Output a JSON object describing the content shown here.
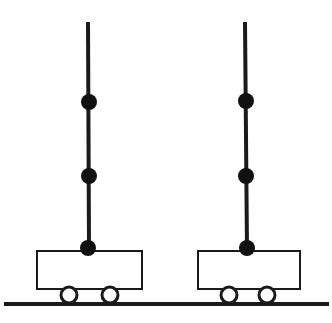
{
  "figure": {
    "canvas": {
      "width": 332,
      "height": 323,
      "background": "#ffffff"
    },
    "colors": {
      "stroke": "#1a1a1a",
      "bead_fill": "#111111",
      "wheel_fill": "#ffffff",
      "cart_fill": "#ffffff",
      "ground": "#1a1a1a"
    },
    "ground": {
      "label": "ground-line",
      "x1": 4,
      "y1": 304,
      "x2": 329,
      "y2": 304,
      "thickness": 4
    },
    "systems": [
      {
        "name": "left-cart-pendulum",
        "rod": {
          "x_top": 88,
          "y_top": 22,
          "x_bottom": 89,
          "y_bottom": 250,
          "thickness": 4
        },
        "beads": [
          {
            "name": "bead-upper",
            "cx": 89,
            "cy": 102,
            "r": 8
          },
          {
            "name": "bead-middle",
            "cx": 89,
            "cy": 176,
            "r": 8
          },
          {
            "name": "bead-pivot",
            "cx": 88,
            "cy": 248,
            "r": 8
          }
        ],
        "cart_body": {
          "x": 37,
          "y": 251,
          "width": 105,
          "height": 38,
          "thickness": 2
        },
        "wheels": [
          {
            "name": "wheel-left",
            "cx": 69,
            "cy": 295,
            "r": 8,
            "thickness": 3
          },
          {
            "name": "wheel-right",
            "cx": 110,
            "cy": 295,
            "r": 8,
            "thickness": 3
          }
        ]
      },
      {
        "name": "right-cart-pendulum",
        "rod": {
          "x_top": 245,
          "y_top": 22,
          "x_bottom": 247,
          "y_bottom": 250,
          "thickness": 4
        },
        "beads": [
          {
            "name": "bead-upper",
            "cx": 246,
            "cy": 101,
            "r": 8
          },
          {
            "name": "bead-middle",
            "cx": 246,
            "cy": 176,
            "r": 8
          },
          {
            "name": "bead-pivot",
            "cx": 247,
            "cy": 248,
            "r": 8
          }
        ],
        "cart_body": {
          "x": 198,
          "y": 251,
          "width": 102,
          "height": 38,
          "thickness": 2
        },
        "wheels": [
          {
            "name": "wheel-left",
            "cx": 229,
            "cy": 295,
            "r": 8,
            "thickness": 3
          },
          {
            "name": "wheel-right",
            "cx": 267,
            "cy": 295,
            "r": 8,
            "thickness": 3
          }
        ]
      }
    ]
  }
}
